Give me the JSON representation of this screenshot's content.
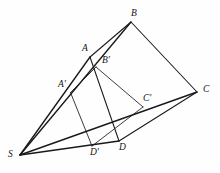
{
  "figure": {
    "type": "geometric-line-diagram",
    "width": 220,
    "height": 173,
    "background_color": "#fefefe",
    "line_color": "#191919",
    "label_color": "#121212"
  },
  "points": {
    "S": {
      "label": "S",
      "x": 20.0,
      "y": 155.0,
      "label_x": 8.0,
      "label_y": 149.5
    },
    "A": {
      "label": "A",
      "x": 90.0,
      "y": 57.0,
      "label_x": 82.0,
      "label_y": 44.0
    },
    "B": {
      "label": "B",
      "x": 131.0,
      "y": 22.0,
      "label_x": 131.0,
      "label_y": 9.0
    },
    "C": {
      "label": "C",
      "x": 197.0,
      "y": 92.0,
      "label_x": 203.0,
      "label_y": 85.0
    },
    "D": {
      "label": "D",
      "x": 119.0,
      "y": 141.0,
      "label_x": 119.0,
      "label_y": 142.5
    },
    "Ap": {
      "label": "A'",
      "x": 70.5,
      "y": 92.5,
      "label_x": 58.0,
      "label_y": 80.0
    },
    "Bp": {
      "label": "B'",
      "x": 96.0,
      "y": 67.0,
      "label_x": 102.0,
      "label_y": 55.5
    },
    "Cp": {
      "label": "C'",
      "x": 143.0,
      "y": 107.0,
      "label_x": 143.0,
      "label_y": 93.5
    },
    "Dp": {
      "label": "D'",
      "x": 92.0,
      "y": 146.0,
      "label_x": 90.0,
      "label_y": 148.0
    }
  },
  "segments": [
    {
      "name": "quad-ABCD-side-AB",
      "from": "A",
      "to": "B",
      "weight": "w-med"
    },
    {
      "name": "quad-ABCD-side-BC",
      "from": "B",
      "to": "C",
      "weight": "w-med"
    },
    {
      "name": "quad-ABCD-side-CD",
      "from": "C",
      "to": "D",
      "weight": "w-med"
    },
    {
      "name": "quad-ABCD-side-DA",
      "from": "D",
      "to": "A",
      "weight": "w-med"
    },
    {
      "name": "quad-ApBpCpDp-side-ApBp",
      "from": "Ap",
      "to": "Bp",
      "weight": "w-thin"
    },
    {
      "name": "quad-ApBpCpDp-side-BpCp",
      "from": "Bp",
      "to": "Cp",
      "weight": "w-thin"
    },
    {
      "name": "quad-ApBpCpDp-side-CpDp",
      "from": "Cp",
      "to": "Dp",
      "weight": "w-thin"
    },
    {
      "name": "quad-ApBpCpDp-side-DpAp",
      "from": "Dp",
      "to": "Ap",
      "weight": "w-thin"
    },
    {
      "name": "projection-ray-S-to-B",
      "from": "S",
      "to": "B",
      "weight": "w-thick"
    },
    {
      "name": "projection-ray-S-to-C",
      "from": "S",
      "to": "C",
      "weight": "w-thick"
    },
    {
      "name": "projection-ray-S-to-A",
      "from": "S",
      "to": "A",
      "weight": "w-thick"
    },
    {
      "name": "projection-ray-S-to-D",
      "from": "S",
      "to": "D",
      "weight": "w-thick"
    }
  ],
  "labels_order": [
    "B",
    "A",
    "Bp",
    "Ap",
    "Cp",
    "C",
    "Dp",
    "D",
    "S"
  ]
}
